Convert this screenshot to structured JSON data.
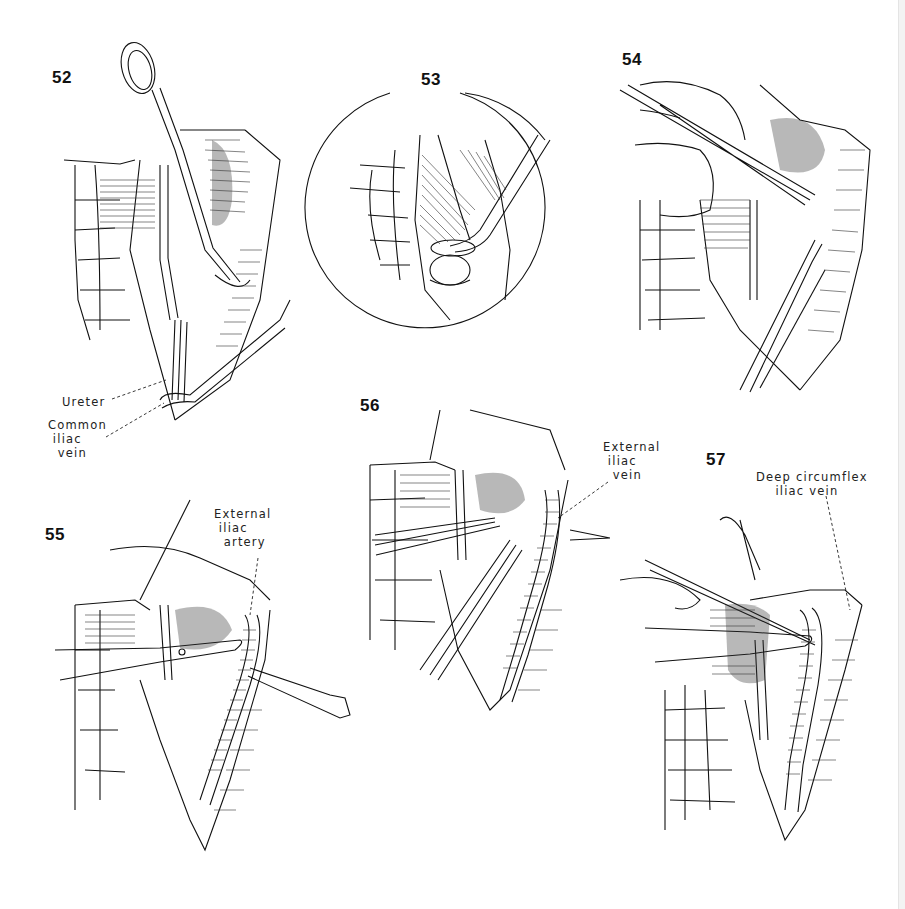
{
  "page": {
    "type": "surgical illustration plate",
    "background": "#ffffff",
    "ink": "#111111"
  },
  "figures": [
    {
      "number": "52",
      "labels": [
        {
          "id": "ureter",
          "text": "Ureter"
        },
        {
          "id": "common-iliac-vein",
          "lines": [
            "Common",
            "iliac",
            "vein"
          ]
        }
      ]
    },
    {
      "number": "53",
      "inset": "circular magnified view",
      "labels": []
    },
    {
      "number": "54",
      "labels": []
    },
    {
      "number": "55",
      "labels": [
        {
          "id": "external-iliac-artery",
          "lines": [
            "External",
            "iliac",
            "artery"
          ]
        }
      ]
    },
    {
      "number": "56",
      "labels": [
        {
          "id": "external-iliac-vein",
          "lines": [
            "External",
            "iliac",
            "vein"
          ]
        }
      ]
    },
    {
      "number": "57",
      "labels": [
        {
          "id": "deep-circumflex-iliac-vein",
          "lines": [
            "Deep circumflex",
            "iliac vein"
          ]
        }
      ]
    }
  ],
  "text": {
    "f52_ureter": "Ureter",
    "f52_common": "Common\n iliac\n  vein",
    "f55_label": "External\n iliac\n  artery",
    "f56_label": "External\n iliac\n  vein",
    "f57_label": "Deep circumflex\n    iliac vein"
  }
}
